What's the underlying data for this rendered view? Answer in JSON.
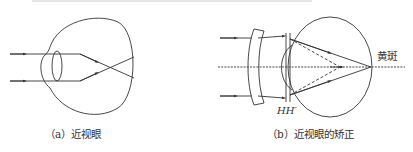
{
  "figures": [
    {
      "id": "a",
      "caption": "（a）近视眼"
    },
    {
      "id": "b",
      "caption": "（b）近视眼的矫正",
      "labels": {
        "macula": "黄斑",
        "principal_planes": "HH′"
      }
    }
  ],
  "colors": {
    "line": "#333333",
    "background": "#ffffff"
  }
}
